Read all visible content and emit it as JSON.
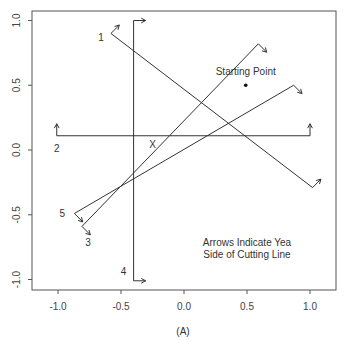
{
  "chart_data": {
    "type": "line",
    "title": "",
    "caption": "(A)",
    "xlabel": "",
    "ylabel": "",
    "xlim": [
      -1.2,
      1.2
    ],
    "ylim": [
      -1.07,
      1.07
    ],
    "xticks": [
      -1.0,
      -0.5,
      0.0,
      0.5,
      1.0
    ],
    "xtick_labels": [
      "-1.0",
      "-0.5",
      "0.0",
      "0.5",
      "1.0"
    ],
    "yticks": [
      -1.0,
      -0.5,
      0.0,
      0.5,
      1.0
    ],
    "ytick_labels": [
      "-1.0",
      "-0.5",
      "0.0",
      "0.5",
      "1.0"
    ],
    "grid": false,
    "cutting_lines": [
      {
        "label": "1",
        "start": [
          -0.58,
          0.9
        ],
        "end": [
          1.02,
          -0.29
        ],
        "yea_direction": "up-right"
      },
      {
        "label": "2",
        "start": [
          -1.01,
          0.11
        ],
        "end": [
          1.0,
          0.11
        ],
        "yea_direction": "up"
      },
      {
        "label": "3",
        "start": [
          -0.81,
          -0.59
        ],
        "end": [
          0.59,
          0.82
        ],
        "yea_direction": "down-right"
      },
      {
        "label": "4",
        "start": [
          -0.4,
          -1.01
        ],
        "end": [
          -0.4,
          1.0
        ],
        "yea_direction": "right"
      },
      {
        "label": "5",
        "start": [
          -0.87,
          -0.49
        ],
        "end": [
          0.87,
          0.5
        ],
        "yea_direction": "down-right"
      }
    ],
    "starting_point": {
      "label": "Starting Point",
      "x": 0.49,
      "y": 0.5
    },
    "ideal_point": {
      "label": "X",
      "x": -0.25,
      "y": 0.05
    },
    "annotation": [
      "Arrows Indicate Yea",
      "Side of Cutting Line"
    ]
  }
}
